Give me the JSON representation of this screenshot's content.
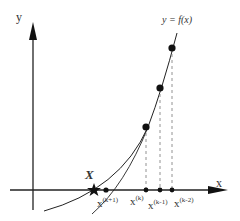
{
  "figure": {
    "y_axis_label": "y",
    "x_axis_label": "x",
    "curve_label": "y = f(x)",
    "root_label": "X",
    "iterate_labels": [
      {
        "base": "x",
        "sup": "(k+1)"
      },
      {
        "base": "x",
        "sup": "(k)"
      },
      {
        "base": "x",
        "sup": "(k-1)"
      },
      {
        "base": "x",
        "sup": "(k-2)"
      }
    ]
  },
  "colors": {
    "stroke": "#222222",
    "dashed": "#777777",
    "text": "#333333"
  }
}
